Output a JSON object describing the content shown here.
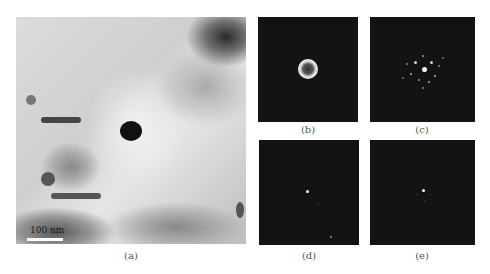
{
  "figure": {
    "panels": [
      {
        "id": "a",
        "label": "(a)",
        "type": "bright-field micrograph",
        "scale_bar": "100 nm"
      },
      {
        "id": "b",
        "label": "(b)",
        "type": "diffraction pattern (ring)"
      },
      {
        "id": "c",
        "label": "(c)",
        "type": "diffraction pattern (spot array)"
      },
      {
        "id": "d",
        "label": "(d)",
        "type": "diffraction pattern (sparse spots)"
      },
      {
        "id": "e",
        "label": "(e)",
        "type": "diffraction pattern (central spot)"
      }
    ],
    "colors": {
      "background": "#ffffff",
      "diffraction_bg": "#131313",
      "label_text": "#555555"
    }
  }
}
